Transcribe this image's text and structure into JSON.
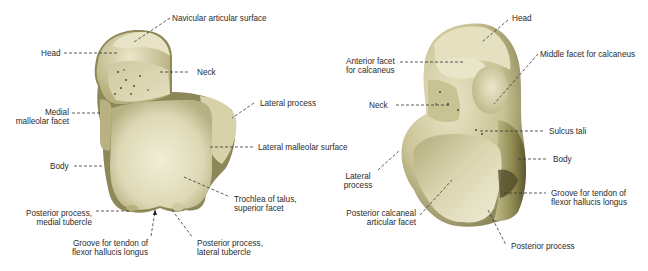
{
  "figure": {
    "colors": {
      "background": "#ffffff",
      "bone_light": "#e8e4c4",
      "bone_mid": "#cfc9a0",
      "bone_shadow": "#8a8455",
      "bone_dark": "#5e5a33",
      "leader_line": "#333333",
      "label_text": "#2b2b2b"
    },
    "left_view": {
      "labels": [
        {
          "id": "navicular",
          "text": "Navicular articular surface"
        },
        {
          "id": "head",
          "text": "Head"
        },
        {
          "id": "neck",
          "text": "Neck"
        },
        {
          "id": "medial_malleolar",
          "text": "Medial\nmalleolar facet"
        },
        {
          "id": "lateral_process",
          "text": "Lateral process"
        },
        {
          "id": "lateral_malleolar",
          "text": "Lateral malleolar surface"
        },
        {
          "id": "body",
          "text": "Body"
        },
        {
          "id": "trochlea",
          "text": "Trochlea of talus,\nsuperior facet"
        },
        {
          "id": "post_medial",
          "text": "Posterior process,\nmedial tubercle"
        },
        {
          "id": "groove_fhl",
          "text": "Groove for tendon of\nflexor hallucis longus"
        },
        {
          "id": "post_lateral",
          "text": "Posterior process,\nlateral tubercle"
        }
      ]
    },
    "right_view": {
      "labels": [
        {
          "id": "head",
          "text": "Head"
        },
        {
          "id": "anterior_facet",
          "text": "Anterior facet\nfor calcaneus"
        },
        {
          "id": "middle_facet",
          "text": "Middle facet for calcaneus"
        },
        {
          "id": "neck",
          "text": "Neck"
        },
        {
          "id": "sulcus_tali",
          "text": "Sulcus tali"
        },
        {
          "id": "body",
          "text": "Body"
        },
        {
          "id": "lateral_process",
          "text": "Lateral\nprocess"
        },
        {
          "id": "groove_fhl",
          "text": "Groove for tendon of\nflexor hallucis longus"
        },
        {
          "id": "post_calc_facet",
          "text": "Posterior calcaneal\narticular facet"
        },
        {
          "id": "posterior_process",
          "text": "Posterior process"
        }
      ]
    }
  }
}
